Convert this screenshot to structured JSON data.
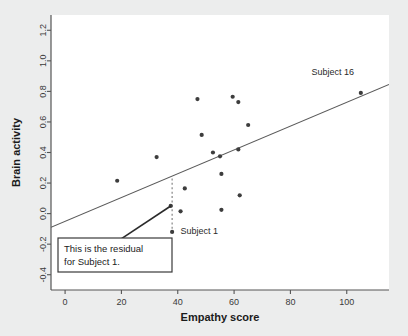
{
  "chart_data": {
    "type": "scatter",
    "title": "",
    "xlabel": "Empathy score",
    "ylabel": "Brain activity",
    "xlim": [
      -5,
      115
    ],
    "ylim": [
      -0.5,
      1.3
    ],
    "xticks": [
      0,
      20,
      40,
      60,
      80,
      100
    ],
    "xtick_labels": [
      "0",
      "20",
      "40",
      "60",
      "80",
      "100"
    ],
    "yticks": [
      -0.4,
      -0.2,
      0.0,
      0.2,
      0.4,
      0.6,
      0.8,
      1.0,
      1.2
    ],
    "ytick_labels": [
      "-0.4",
      "-0.2",
      "0.0",
      "0.2",
      "0.4",
      "0.6",
      "0.8",
      "1.0",
      "1.2"
    ],
    "grid": false,
    "legend": "none",
    "points": [
      {
        "x": 18.5,
        "y": 0.215
      },
      {
        "x": 32.5,
        "y": 0.37
      },
      {
        "x": 37.5,
        "y": 0.05
      },
      {
        "x": 38.0,
        "y": -0.12
      },
      {
        "x": 41.0,
        "y": 0.015
      },
      {
        "x": 42.5,
        "y": 0.165
      },
      {
        "x": 47.0,
        "y": 0.75
      },
      {
        "x": 48.5,
        "y": 0.515
      },
      {
        "x": 52.5,
        "y": 0.4
      },
      {
        "x": 55.0,
        "y": 0.375
      },
      {
        "x": 55.5,
        "y": 0.26
      },
      {
        "x": 55.5,
        "y": 0.025
      },
      {
        "x": 59.5,
        "y": 0.765
      },
      {
        "x": 61.5,
        "y": 0.73
      },
      {
        "x": 61.5,
        "y": 0.42
      },
      {
        "x": 62.0,
        "y": 0.12
      },
      {
        "x": 65.0,
        "y": 0.58
      },
      {
        "x": 105.0,
        "y": 0.79
      }
    ],
    "regression_line": {
      "x_start": -5,
      "y_start": -0.09,
      "x_end": 115,
      "y_end": 0.845
    },
    "residual_segment": {
      "x": 38.0,
      "y_top": 0.23,
      "y_bottom": -0.12,
      "style": "dashed"
    },
    "annotations": [
      {
        "name": "subject-16-label",
        "text": "Subject 16",
        "x": 95.0,
        "y": 0.905
      },
      {
        "name": "subject-1-label",
        "text": "Subject 1",
        "x": 41.0,
        "y": -0.135
      },
      {
        "name": "residual-callout-line1",
        "text": "This is the residual",
        "x": 3.0,
        "y": -0.41
      },
      {
        "name": "residual-callout-line2",
        "text": "for Subject 1.",
        "x": 3.0,
        "y": -0.47
      }
    ],
    "callout_box": {
      "line1": "This is the residual",
      "line2": "for Subject 1.",
      "pointer_from_x": 17.5,
      "pointer_from_y": -0.195,
      "pointer_to_x": 37.5,
      "pointer_to_y": 0.05
    },
    "colors": {
      "background": "#eceded",
      "plot_area": "#ffffff",
      "point": "#3d3d3d",
      "line": "#5a5a5a",
      "residual": "#7a7a7a",
      "axis": "#555555",
      "text": "#1b1b1b",
      "callout_border": "#3a3a3a"
    }
  }
}
